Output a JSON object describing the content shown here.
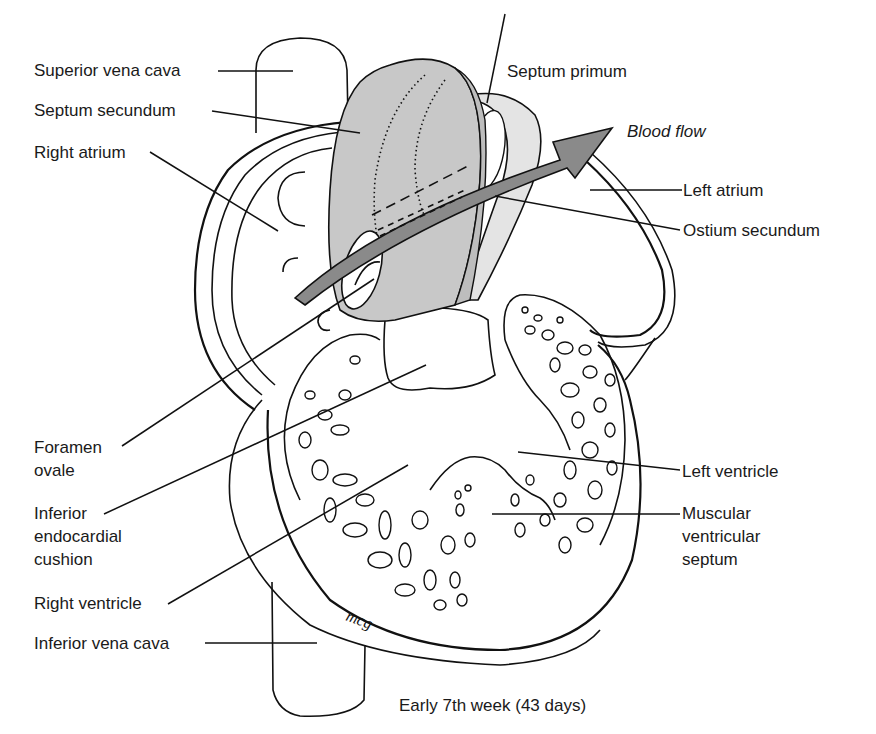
{
  "figure": {
    "caption": "Early 7th week (43 days)",
    "signature": "mcg",
    "colors": {
      "septum_secundum_fill": "#c8c8c8",
      "septum_primum_fill": "#e4e4e4",
      "arrow_fill": "#8a8a8a",
      "line": "#111111",
      "background": "#ffffff"
    },
    "labels": {
      "superior_vena_cava": "Superior vena cava",
      "septum_secundum": "Septum secundum",
      "right_atrium": "Right atrium",
      "septum_primum": "Septum primum",
      "blood_flow": "Blood flow",
      "left_atrium": "Left atrium",
      "ostium_secundum": "Ostium secundum",
      "foramen_ovale_1": "Foramen",
      "foramen_ovale_2": "ovale",
      "inferior_endocardial_cushion_1": "Inferior",
      "inferior_endocardial_cushion_2": "endocardial",
      "inferior_endocardial_cushion_3": "cushion",
      "right_ventricle": "Right ventricle",
      "inferior_vena_cava": "Inferior vena cava",
      "left_ventricle": "Left ventricle",
      "muscular_ventricular_septum_1": "Muscular",
      "muscular_ventricular_septum_2": "ventricular",
      "muscular_ventricular_septum_3": "septum"
    }
  }
}
